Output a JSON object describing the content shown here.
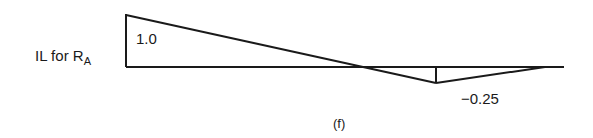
{
  "diagram": {
    "label": {
      "prefix": "IL for R",
      "subscript": "A"
    },
    "values": {
      "max_label": "1.0",
      "min_label": "−0.25"
    },
    "caption": "(f)",
    "colors": {
      "line": "#1a1a1a",
      "background": "#ffffff"
    },
    "geometry": {
      "baseline_start_x": 126,
      "baseline_end_x": 564,
      "baseline_y": 67,
      "peak_y": 15,
      "zero_crossing_x": 358,
      "min_x": 436,
      "min_y": 83,
      "right_support_x": 545
    }
  }
}
